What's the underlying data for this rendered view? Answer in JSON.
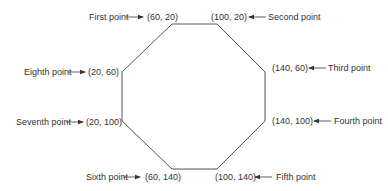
{
  "diagram": {
    "type": "octagon-vertex-labels",
    "stroke_color": "#555555",
    "text_color": "#333333",
    "vertices": [
      {
        "id": "first",
        "label": "First point",
        "coords": "(60, 20)",
        "x": 60,
        "y": 20
      },
      {
        "id": "second",
        "label": "Second point",
        "coords": "(100, 20)",
        "x": 100,
        "y": 20
      },
      {
        "id": "third",
        "label": "Third point",
        "coords": "(140, 60)",
        "x": 140,
        "y": 60
      },
      {
        "id": "fourth",
        "label": "Fourth point",
        "coords": "(140, 100)",
        "x": 140,
        "y": 100
      },
      {
        "id": "fifth",
        "label": "Fifth point",
        "coords": "(100, 140)",
        "x": 100,
        "y": 140
      },
      {
        "id": "sixth",
        "label": "Sixth point",
        "coords": "(60, 140)",
        "x": 60,
        "y": 140
      },
      {
        "id": "seventh",
        "label": "Seventh point",
        "coords": "(20, 100)",
        "x": 20,
        "y": 100
      },
      {
        "id": "eighth",
        "label": "Eighth point",
        "coords": "(20, 60)",
        "x": 20,
        "y": 60
      }
    ]
  }
}
